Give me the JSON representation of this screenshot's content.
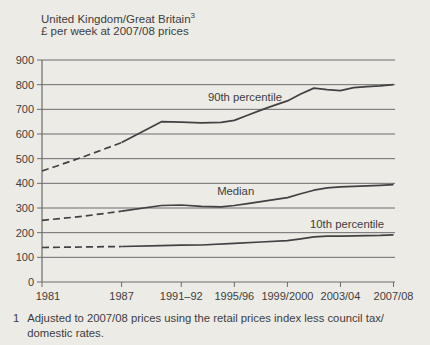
{
  "header": {
    "title": "United Kingdom/Great Britain",
    "title_sup": "3",
    "subtitle": "£ per week at 2007/08 prices"
  },
  "footnote": {
    "marker": "1",
    "line1": "Adjusted to 2007/08 prices using the retail prices index less council tax/",
    "line2": "domestic rates."
  },
  "colors": {
    "background": "#edebe5",
    "text": "#3d3d3d",
    "grid": "#6b6c6e",
    "series_line": "#414143"
  },
  "chart_data": {
    "type": "line",
    "title": "United Kingdom/Great Britain",
    "subtitle": "£ per week at 2007/08 prices",
    "ylabel": "£ per week at 2007/08 prices",
    "ylim": [
      0,
      900
    ],
    "ytick_step": 100,
    "grid": true,
    "legend_position": "inline-labels",
    "xlim": [
      1981,
      2007.5
    ],
    "dashed_until_year": 1987,
    "dash_note": "values before 1987 shown as dashed line",
    "x_ticks": [
      {
        "label": "1981",
        "year": 1981
      },
      {
        "label": "1987",
        "year": 1987
      },
      {
        "label": "1991–92",
        "year": 1991.5
      },
      {
        "label": "1995/96",
        "year": 1995.5
      },
      {
        "label": "1999/2000",
        "year": 1999.5
      },
      {
        "label": "2003/04",
        "year": 2003.5
      },
      {
        "label": "2007/08",
        "year": 2007.5
      }
    ],
    "series": [
      {
        "name": "90th percentile",
        "label_anchor": {
          "year": 1996.3,
          "value": 734
        },
        "points": [
          [
            1981,
            450
          ],
          [
            1984,
            505
          ],
          [
            1987,
            565
          ],
          [
            1990,
            650
          ],
          [
            1991.5,
            648
          ],
          [
            1993,
            645
          ],
          [
            1994.5,
            647
          ],
          [
            1995.5,
            655
          ],
          [
            1996.5,
            676
          ],
          [
            1997.5,
            697
          ],
          [
            1998.5,
            716
          ],
          [
            1999.5,
            734
          ],
          [
            2000.5,
            762
          ],
          [
            2001.5,
            786
          ],
          [
            2002.5,
            780
          ],
          [
            2003.5,
            776
          ],
          [
            2004.5,
            788
          ],
          [
            2005.5,
            792
          ],
          [
            2006.5,
            795
          ],
          [
            2007.5,
            800
          ]
        ]
      },
      {
        "name": "Median",
        "label_anchor": {
          "year": 1995.6,
          "value": 353
        },
        "points": [
          [
            1981,
            250
          ],
          [
            1984,
            266
          ],
          [
            1987,
            287
          ],
          [
            1990,
            310
          ],
          [
            1991.5,
            312
          ],
          [
            1993,
            307
          ],
          [
            1994.5,
            305
          ],
          [
            1995.5,
            310
          ],
          [
            1996.5,
            318
          ],
          [
            1997.5,
            326
          ],
          [
            1998.5,
            334
          ],
          [
            1999.5,
            342
          ],
          [
            2000.5,
            358
          ],
          [
            2001.5,
            372
          ],
          [
            2002.5,
            382
          ],
          [
            2003.5,
            386
          ],
          [
            2004.5,
            388
          ],
          [
            2005.5,
            390
          ],
          [
            2006.5,
            392
          ],
          [
            2007.5,
            395
          ]
        ]
      },
      {
        "name": "10th percentile",
        "label_anchor": {
          "year": 2004.0,
          "value": 219
        },
        "points": [
          [
            1981,
            140
          ],
          [
            1984,
            142
          ],
          [
            1987,
            144
          ],
          [
            1990,
            147
          ],
          [
            1991.5,
            149
          ],
          [
            1993,
            150
          ],
          [
            1995.5,
            157
          ],
          [
            1997.5,
            162
          ],
          [
            1999.5,
            168
          ],
          [
            2000.5,
            175
          ],
          [
            2001.5,
            183
          ],
          [
            2002.5,
            186
          ],
          [
            2003.5,
            186
          ],
          [
            2004.5,
            187
          ],
          [
            2005.5,
            188
          ],
          [
            2006.5,
            189
          ],
          [
            2007.5,
            191
          ]
        ]
      }
    ]
  }
}
